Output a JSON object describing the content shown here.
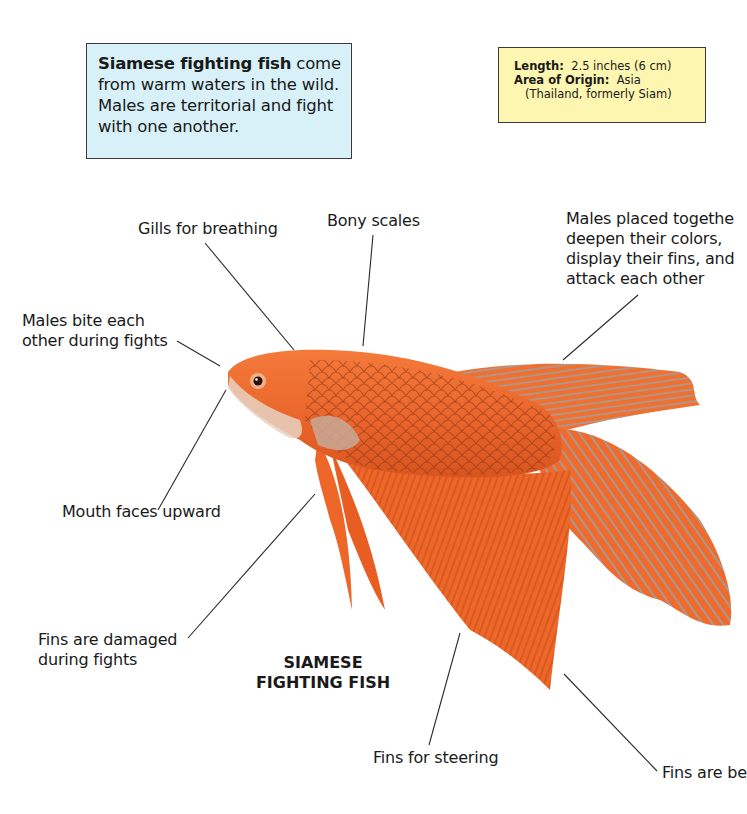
{
  "intro_box": {
    "bold_text": "Siamese fighting fish",
    "text": " come from warm waters in the wild.  Males are territorial and fight with one another.",
    "background": "#d8f1f8"
  },
  "facts_box": {
    "length_label": "Length:",
    "length_value": "2.5 inches (6 cm)",
    "origin_label": "Area of Origin:",
    "origin_value": "Asia",
    "origin_detail": "(Thailand, formerly Siam)",
    "background": "#fdf6b0"
  },
  "diagram_title": {
    "line1": "SIAMESE",
    "line2": "FIGHTING FISH"
  },
  "callouts": [
    {
      "id": "gills",
      "lines": [
        "Gills for breathing"
      ]
    },
    {
      "id": "scales",
      "lines": [
        "Bony scales"
      ]
    },
    {
      "id": "males-together",
      "lines": [
        "Males placed togethe",
        "deepen their colors,",
        "display their fins, and",
        "attack each other"
      ]
    },
    {
      "id": "bite",
      "lines": [
        "Males bite each",
        "other during fights"
      ]
    },
    {
      "id": "mouth",
      "lines": [
        "Mouth faces upward"
      ]
    },
    {
      "id": "damaged",
      "lines": [
        "Fins are damaged",
        "during fights"
      ]
    },
    {
      "id": "steering",
      "lines": [
        "Fins for steering"
      ]
    },
    {
      "id": "fins-bright",
      "lines": [
        "Fins are be"
      ]
    }
  ],
  "colors": {
    "fish_orange": "#f06a2a",
    "fish_dark": "#c24a18",
    "fin_streak": "#9aa3a8",
    "leader_line": "#2a2a2a"
  }
}
